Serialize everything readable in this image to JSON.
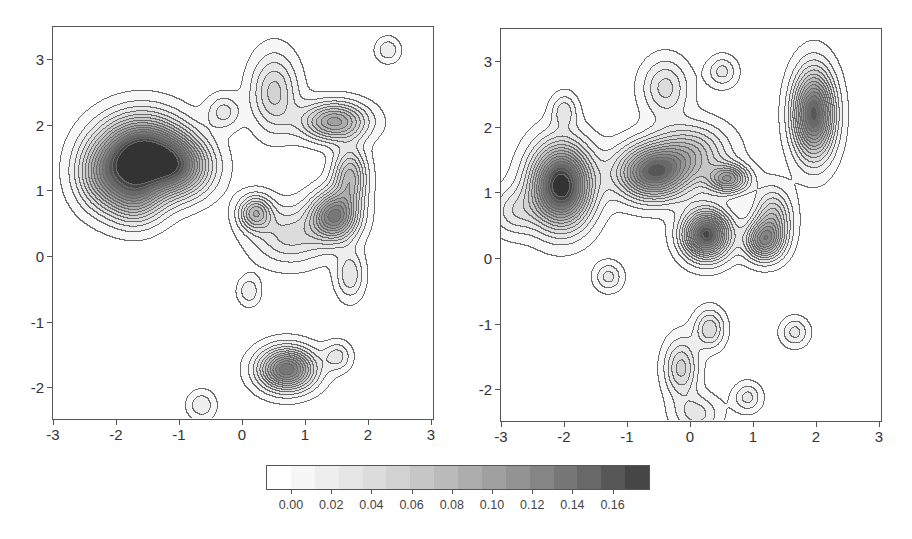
{
  "chart_data": [
    {
      "type": "heatmap",
      "subtype": "filled-contour",
      "title": "",
      "xlabel": "",
      "ylabel": "",
      "xlim": [
        -3,
        3
      ],
      "ylim": [
        -2.5,
        3.5
      ],
      "xticks": [
        -3,
        -2,
        -1,
        0,
        1,
        2,
        3
      ],
      "yticks": [
        -2,
        -1,
        0,
        1,
        2,
        3
      ],
      "peaks": [
        {
          "x": -1.6,
          "y": 1.55,
          "value": 0.165,
          "sx": 0.45,
          "sy": 0.38
        },
        {
          "x": -1.0,
          "y": 1.35,
          "value": 0.09,
          "sx": 0.35,
          "sy": 0.3
        },
        {
          "x": -1.7,
          "y": 0.9,
          "value": 0.07,
          "sx": 0.3,
          "sy": 0.3
        },
        {
          "x": -2.2,
          "y": 1.2,
          "value": 0.06,
          "sx": 0.3,
          "sy": 0.35
        },
        {
          "x": 1.45,
          "y": 2.05,
          "value": 0.09,
          "sx": 0.35,
          "sy": 0.2
        },
        {
          "x": 1.45,
          "y": 0.6,
          "value": 0.115,
          "sx": 0.25,
          "sy": 0.25
        },
        {
          "x": 1.7,
          "y": 1.2,
          "value": 0.07,
          "sx": 0.18,
          "sy": 0.3
        },
        {
          "x": 0.2,
          "y": 0.65,
          "value": 0.07,
          "sx": 0.18,
          "sy": 0.18
        },
        {
          "x": 0.5,
          "y": 2.5,
          "value": 0.05,
          "sx": 0.25,
          "sy": 0.4
        },
        {
          "x": -0.3,
          "y": 2.2,
          "value": 0.03,
          "sx": 0.18,
          "sy": 0.18
        },
        {
          "x": 0.75,
          "y": 0.3,
          "value": 0.04,
          "sx": 0.4,
          "sy": 0.3
        },
        {
          "x": 1.7,
          "y": -0.3,
          "value": 0.035,
          "sx": 0.15,
          "sy": 0.25
        },
        {
          "x": 0.1,
          "y": -0.55,
          "value": 0.025,
          "sx": 0.12,
          "sy": 0.15
        },
        {
          "x": 0.7,
          "y": -1.75,
          "value": 0.125,
          "sx": 0.3,
          "sy": 0.22
        },
        {
          "x": 1.5,
          "y": -1.55,
          "value": 0.03,
          "sx": 0.15,
          "sy": 0.15
        },
        {
          "x": -0.65,
          "y": -2.3,
          "value": 0.025,
          "sx": 0.15,
          "sy": 0.15
        },
        {
          "x": 2.3,
          "y": 3.15,
          "value": 0.025,
          "sx": 0.13,
          "sy": 0.13
        }
      ]
    },
    {
      "type": "heatmap",
      "subtype": "filled-contour",
      "title": "",
      "xlabel": "",
      "ylabel": "",
      "xlim": [
        -3,
        3
      ],
      "ylim": [
        -2.5,
        3.5
      ],
      "xticks": [
        -3,
        -2,
        -1,
        0,
        1,
        2,
        3
      ],
      "yticks": [
        -2,
        -1,
        0,
        1,
        2,
        3
      ],
      "peaks": [
        {
          "x": -2.05,
          "y": 1.1,
          "value": 0.17,
          "sx": 0.32,
          "sy": 0.42
        },
        {
          "x": -0.6,
          "y": 1.3,
          "value": 0.13,
          "sx": 0.38,
          "sy": 0.28
        },
        {
          "x": 0.25,
          "y": 0.35,
          "value": 0.15,
          "sx": 0.25,
          "sy": 0.25
        },
        {
          "x": 0.6,
          "y": 1.2,
          "value": 0.09,
          "sx": 0.22,
          "sy": 0.15
        },
        {
          "x": 1.95,
          "y": 2.2,
          "value": 0.14,
          "sx": 0.22,
          "sy": 0.45
        },
        {
          "x": 1.15,
          "y": 0.25,
          "value": 0.09,
          "sx": 0.2,
          "sy": 0.2
        },
        {
          "x": 1.3,
          "y": 0.6,
          "value": 0.06,
          "sx": 0.2,
          "sy": 0.3
        },
        {
          "x": 0.0,
          "y": 1.6,
          "value": 0.06,
          "sx": 0.4,
          "sy": 0.3
        },
        {
          "x": -0.4,
          "y": 2.6,
          "value": 0.04,
          "sx": 0.25,
          "sy": 0.3
        },
        {
          "x": 0.5,
          "y": 2.85,
          "value": 0.03,
          "sx": 0.16,
          "sy": 0.16
        },
        {
          "x": -2.0,
          "y": 2.25,
          "value": 0.03,
          "sx": 0.14,
          "sy": 0.18
        },
        {
          "x": -2.8,
          "y": 0.7,
          "value": 0.03,
          "sx": 0.25,
          "sy": 0.25
        },
        {
          "x": -1.3,
          "y": -0.3,
          "value": 0.03,
          "sx": 0.15,
          "sy": 0.15
        },
        {
          "x": 0.3,
          "y": -1.1,
          "value": 0.045,
          "sx": 0.16,
          "sy": 0.2
        },
        {
          "x": -0.15,
          "y": -1.7,
          "value": 0.05,
          "sx": 0.18,
          "sy": 0.3
        },
        {
          "x": 0.1,
          "y": -2.4,
          "value": 0.03,
          "sx": 0.25,
          "sy": 0.2
        },
        {
          "x": 0.9,
          "y": -2.15,
          "value": 0.03,
          "sx": 0.15,
          "sy": 0.15
        },
        {
          "x": 1.65,
          "y": -1.15,
          "value": 0.03,
          "sx": 0.15,
          "sy": 0.15
        }
      ]
    }
  ],
  "colorbar": {
    "tick_labels": [
      "0.00",
      "0.02",
      "0.04",
      "0.06",
      "0.08",
      "0.10",
      "0.12",
      "0.14",
      "0.16"
    ],
    "tick_values": [
      0.0,
      0.02,
      0.04,
      0.06,
      0.08,
      0.1,
      0.12,
      0.14,
      0.16
    ],
    "levels": [
      0.0,
      0.01,
      0.02,
      0.03,
      0.04,
      0.05,
      0.06,
      0.07,
      0.08,
      0.09,
      0.1,
      0.11,
      0.12,
      0.13,
      0.14,
      0.15,
      0.16
    ],
    "colors": [
      "#ffffff",
      "#f7f7f7",
      "#eeeeee",
      "#e6e6e6",
      "#dcdcdc",
      "#d2d2d2",
      "#c6c6c6",
      "#bababa",
      "#adadad",
      "#a0a0a0",
      "#939393",
      "#858585",
      "#777777",
      "#686868",
      "#575757",
      "#464646",
      "#333333"
    ]
  },
  "panels": [
    {
      "x_tick_labels": [
        "-3",
        "-2",
        "-1",
        "0",
        "1",
        "2",
        "3"
      ],
      "y_tick_labels": [
        "3",
        "2",
        "1",
        "0",
        "-1",
        "-2"
      ]
    },
    {
      "x_tick_labels": [
        "-3",
        "-2",
        "-1",
        "0",
        "1",
        "2",
        "3"
      ],
      "y_tick_labels": [
        "3",
        "2",
        "1",
        "0",
        "-1",
        "-2"
      ]
    }
  ]
}
